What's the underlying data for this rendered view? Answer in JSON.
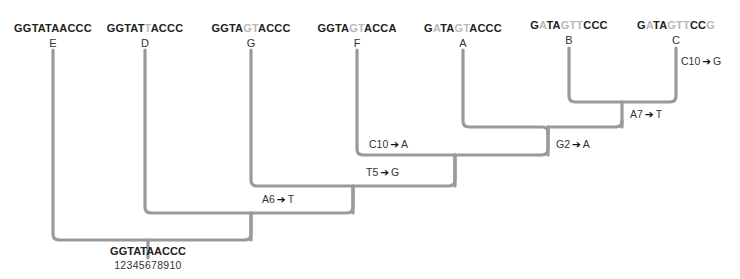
{
  "diagram": {
    "type": "phylogenetic-tree",
    "line_color": "#9a9a9a",
    "mutated_base_color": "#b9b9b9",
    "leaves": [
      {
        "label": "E",
        "sequence": "GGTATAACCC",
        "mutated_positions": [],
        "segments": [
          {
            "t": "GGTATAACCC",
            "m": false
          }
        ]
      },
      {
        "label": "D",
        "sequence": "GGTATTACCC",
        "mutated_positions": [
          6
        ],
        "segments": [
          {
            "t": "GGTAT",
            "m": false
          },
          {
            "t": "T",
            "m": true
          },
          {
            "t": "ACCC",
            "m": false
          }
        ]
      },
      {
        "label": "G",
        "sequence": "GGTAGTACCC",
        "mutated_positions": [
          5,
          6
        ],
        "segments": [
          {
            "t": "GGTA",
            "m": false
          },
          {
            "t": "GT",
            "m": true
          },
          {
            "t": "ACCC",
            "m": false
          }
        ]
      },
      {
        "label": "F",
        "sequence": "GGTAGTACCA",
        "mutated_positions": [
          5,
          6,
          10
        ],
        "segments": [
          {
            "t": "GGTA",
            "m": false
          },
          {
            "t": "GT",
            "m": true
          },
          {
            "t": "ACCA",
            "m": false
          }
        ]
      },
      {
        "label": "A",
        "sequence": "GATAGTACCC",
        "mutated_positions": [
          2,
          5,
          6
        ],
        "segments": [
          {
            "t": "G",
            "m": false
          },
          {
            "t": "A",
            "m": true
          },
          {
            "t": "TA",
            "m": false
          },
          {
            "t": "GT",
            "m": true
          },
          {
            "t": "ACCC",
            "m": false
          }
        ]
      },
      {
        "label": "B",
        "sequence": "GATAGTTCCC",
        "mutated_positions": [
          2,
          5,
          6,
          7
        ],
        "segments": [
          {
            "t": "G",
            "m": false
          },
          {
            "t": "A",
            "m": true
          },
          {
            "t": "TA",
            "m": false
          },
          {
            "t": "GTT",
            "m": true
          },
          {
            "t": "CCC",
            "m": false
          }
        ]
      },
      {
        "label": "C",
        "sequence": "GATAGTTCCG",
        "mutated_positions": [
          2,
          5,
          6,
          7,
          10
        ],
        "segments": [
          {
            "t": "G",
            "m": false
          },
          {
            "t": "A",
            "m": true
          },
          {
            "t": "TA",
            "m": false
          },
          {
            "t": "GTT",
            "m": true
          },
          {
            "t": "CC",
            "m": false
          },
          {
            "t": "G",
            "m": true
          }
        ]
      }
    ],
    "mutations": [
      {
        "from": "C10",
        "to": "G",
        "branch": "C"
      },
      {
        "from": "A7",
        "to": "T",
        "branch": "B+C"
      },
      {
        "from": "G2",
        "to": "A",
        "branch": "A+B+C"
      },
      {
        "from": "C10",
        "to": "A",
        "branch": "F"
      },
      {
        "from": "T5",
        "to": "G",
        "branch": "G+F+A+B+C"
      },
      {
        "from": "A6",
        "to": "T",
        "branch": "D+G+F+A+B+C"
      }
    ],
    "root": {
      "sequence": "GGTATAACCC",
      "positions": "12345678910"
    }
  }
}
